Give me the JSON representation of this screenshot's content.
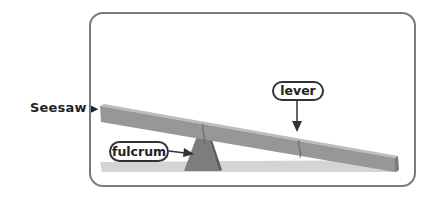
{
  "caption": {
    "label": "Seesaw",
    "pointer": "▶"
  },
  "diagram": {
    "labels": {
      "lever": "lever",
      "fulcrum": "fulcrum"
    },
    "colors": {
      "frame_border": "#7a7a7a",
      "plank_top": "#b5b5b5",
      "plank_side": "#8e8e8e",
      "fulcrum": "#7b7b7b",
      "ground": "#cfcfcf",
      "label_border": "#333333"
    }
  }
}
